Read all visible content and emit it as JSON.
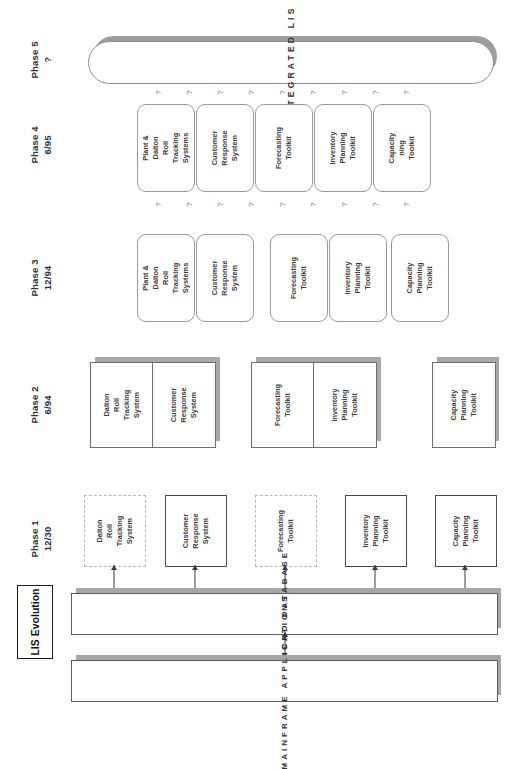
{
  "document": {
    "title": "LIS Evolution"
  },
  "phases": [
    {
      "name": "Phase 1",
      "date": "12/30"
    },
    {
      "name": "Phase 2",
      "date": "6/94"
    },
    {
      "name": "Phase 3",
      "date": "12/94"
    },
    {
      "name": "Phase 4",
      "date": "6/95"
    },
    {
      "name": "Phase 5",
      "date": "?"
    }
  ],
  "phase5": {
    "label": "INTEGRATED LIS"
  },
  "phase4": {
    "boxes": [
      {
        "label": "Plant &\nDalton\nRoll\nTracking\nSystems"
      },
      {
        "label": "Customer\nResponse\nSystem"
      },
      {
        "label": "Forecasting\nToolkit"
      },
      {
        "label": "Inventory\nPlanning\nToolkit"
      },
      {
        "label": "Capacity\nning\nToolkit"
      }
    ]
  },
  "phase3": {
    "boxes": [
      {
        "label": "Plant &\nDalton\nRoll\nTracking\nSystems"
      },
      {
        "label": "Customer\nResponse\nSystem"
      },
      {
        "label": "Forecasting\nToolkit"
      },
      {
        "label": "Inventory\nPlanning\nToolkit"
      },
      {
        "label": "Capacity\nPlanning\nToolkit"
      }
    ]
  },
  "phase2": {
    "boxes": [
      {
        "label": "Dalton\nRoll\nTracking\nSystem"
      },
      {
        "label": "Customer\nResponse\nSystem"
      },
      {
        "label": "Forecasting\nToolkit"
      },
      {
        "label": "Inventory\nPlanning\nToolkit"
      },
      {
        "label": "Capacity\nPlanning\nToolkit"
      }
    ]
  },
  "phase1": {
    "boxes": [
      {
        "label": "Dalton\nRoll\nTracking\nSystem",
        "style": "dashed"
      },
      {
        "label": "Customer\nResponse\nSystem",
        "style": "solid"
      },
      {
        "label": "Forecasting\nToolkit",
        "style": "dashed"
      },
      {
        "label": "Inventory\nPlanning\nToolkit",
        "style": "solid"
      },
      {
        "label": "Capacity\nPlanning\nToolkit",
        "style": "solid"
      }
    ]
  },
  "bars": [
    {
      "label": "JERICHO DATABASE"
    },
    {
      "label": "MAINFRAME APPLICATIONS"
    }
  ],
  "question_marks": {
    "glyph": "?",
    "row_phase3_to_4_count": 9,
    "row_phase4_to_5_count": 9
  },
  "colors": {
    "box_border": "#9a9a9a",
    "shadow": "#a6a6a6",
    "text": "#3b3b3b",
    "title_border": "#1a1a1a"
  }
}
